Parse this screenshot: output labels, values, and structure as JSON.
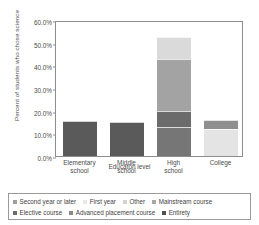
{
  "chart_data": {
    "type": "bar",
    "stacked": true,
    "title": "",
    "xlabel": "Educaton level",
    "ylabel": "Percent of students who chose science",
    "categories": [
      "Elementary school",
      "Middle school",
      "High school",
      "College"
    ],
    "ylim": [
      0,
      60
    ],
    "ytick_labels": [
      "0.0%",
      "10.0%",
      "20.0%",
      "30.0%",
      "40.0%",
      "50.0%",
      "60.0%"
    ],
    "ytick_values": [
      0,
      10,
      20,
      30,
      40,
      50,
      60
    ],
    "grid": false,
    "legend_position": "bottom",
    "series": [
      {
        "name": "Second year or later",
        "color": "#bfbfbf",
        "values": [
          0,
          0,
          0,
          0
        ]
      },
      {
        "name": "First year",
        "color": "#e2e2e2",
        "values": [
          0,
          0,
          0,
          0
        ]
      },
      {
        "name": "Other",
        "color": "#d5d5d5",
        "values": [
          0,
          0,
          0,
          11.8
        ]
      },
      {
        "name": "Mainstream course",
        "color": "#a0a0a0",
        "values": [
          0,
          0,
          13.0,
          0
        ]
      },
      {
        "name": "Elective course",
        "color": "#6e6e6e",
        "values": [
          0,
          0,
          7.0,
          4.2
        ]
      },
      {
        "name": "Advanced placement course",
        "color": "#9b9b9b",
        "values": [
          0,
          0,
          22.8,
          0
        ]
      },
      {
        "name": "Entirety",
        "color": "#5a5a5a",
        "values": [
          15.5,
          14.9,
          0,
          0
        ]
      }
    ],
    "bars": [
      {
        "category": "Elementary school",
        "total": 15.5,
        "segments": [
          {
            "series": "Entirety",
            "value": 15.5,
            "from": 0,
            "to": 15.5,
            "color": "#5a5a5a"
          }
        ]
      },
      {
        "category": "Middle school",
        "total": 14.9,
        "segments": [
          {
            "series": "Entirety",
            "value": 14.9,
            "from": 0,
            "to": 14.9,
            "color": "#5a5a5a"
          }
        ]
      },
      {
        "category": "High school",
        "total": 52.3,
        "segments": [
          {
            "series": "Mainstream course",
            "value": 13.0,
            "from": 0,
            "to": 13.0,
            "color": "#767676"
          },
          {
            "series": "Elective course",
            "value": 7.0,
            "from": 13.0,
            "to": 20.0,
            "color": "#6b6b6b"
          },
          {
            "series": "Advanced placement course",
            "value": 22.8,
            "from": 20.0,
            "to": 42.8,
            "color": "#a3a3a3"
          },
          {
            "series": "Second year or later",
            "value": 9.5,
            "from": 42.8,
            "to": 52.3,
            "color": "#dadada"
          }
        ]
      },
      {
        "category": "College",
        "total": 16.0,
        "segments": [
          {
            "series": "Other",
            "value": 11.8,
            "from": 0,
            "to": 11.8,
            "color": "#e4e4e4"
          },
          {
            "series": "Elective course",
            "value": 4.2,
            "from": 11.8,
            "to": 16.0,
            "color": "#8f8f8f"
          }
        ]
      }
    ]
  },
  "axes": {
    "y_title": "Percent of students who chose science",
    "x_title": "Educaton level",
    "y_ticks": [
      {
        "label": "60.0%",
        "value": 60
      },
      {
        "label": "50.0%",
        "value": 50
      },
      {
        "label": "40.0%",
        "value": 40
      },
      {
        "label": "30.0%",
        "value": 30
      },
      {
        "label": "20.0%",
        "value": 20
      },
      {
        "label": "10.0%",
        "value": 10
      },
      {
        "label": "0.0%",
        "value": 0
      }
    ],
    "x_ticks": [
      {
        "line1": "Elementary",
        "line2": "school"
      },
      {
        "line1": "Middle",
        "line2": "school"
      },
      {
        "line1": "High",
        "line2": "school"
      },
      {
        "line1": "College",
        "line2": ""
      }
    ]
  },
  "legend": {
    "rows": [
      [
        {
          "label": "Second year or later",
          "color": "#9e9e9e"
        },
        {
          "label": "First year",
          "color": "#e8e8e8"
        },
        {
          "label": "Other",
          "color": "#d2d2d2"
        },
        {
          "label": "Mainstream course",
          "color": "#a8a8a8"
        }
      ],
      [
        {
          "label": "Elective course",
          "color": "#6b6b6b"
        },
        {
          "label": "Advanced placement course",
          "color": "#8a8a8a"
        },
        {
          "label": "Entirety",
          "color": "#4f4f4f"
        }
      ]
    ]
  }
}
